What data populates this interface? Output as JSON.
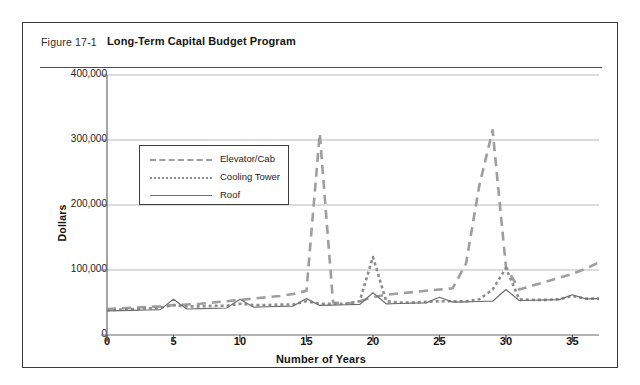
{
  "figure": {
    "number": "Figure 17-1",
    "title": "Long-Term Capital Budget Program"
  },
  "chart_data": {
    "type": "line",
    "title": "Long-Term Capital Budget Program",
    "xlabel": "Number of Years",
    "ylabel": "Dollars",
    "xlim": [
      0,
      37
    ],
    "ylim": [
      0,
      400000
    ],
    "grid": true,
    "legend_position": "upper-left-inside",
    "xticks": [
      0,
      5,
      10,
      15,
      20,
      25,
      30,
      35
    ],
    "xtick_labels": [
      "0",
      "5",
      "10",
      "15",
      "20",
      "25",
      "30",
      "35"
    ],
    "yticks": [
      0,
      100000,
      200000,
      300000,
      400000
    ],
    "ytick_labels": [
      "0",
      "100,000",
      "200,000",
      "300,000",
      "400,000"
    ],
    "x": [
      0,
      1,
      2,
      3,
      4,
      5,
      6,
      7,
      8,
      9,
      10,
      11,
      12,
      13,
      14,
      15,
      16,
      17,
      18,
      19,
      20,
      21,
      22,
      23,
      24,
      25,
      26,
      27,
      28,
      29,
      30,
      31,
      32,
      33,
      34,
      35,
      36,
      37
    ],
    "series": [
      {
        "name": "Elevator/Cab",
        "style": "dashed",
        "color": "#9e9e9e",
        "values": [
          40000,
          41000,
          42000,
          43000,
          44000,
          46000,
          47000,
          48000,
          50000,
          52000,
          54000,
          56000,
          58000,
          60000,
          63000,
          68000,
          310000,
          50000,
          48000,
          52000,
          58000,
          62000,
          64000,
          66000,
          68000,
          70000,
          72000,
          110000,
          230000,
          315000,
          105000,
          70000,
          76000,
          82000,
          88000,
          94000,
          102000,
          112000
        ]
      },
      {
        "name": "Cooling Tower",
        "style": "dotted",
        "color": "#8d8d8d",
        "values": [
          38000,
          39000,
          40000,
          41000,
          42000,
          46000,
          44000,
          44000,
          45000,
          45000,
          48000,
          46000,
          46000,
          47000,
          47000,
          52000,
          48000,
          48000,
          48000,
          52000,
          120000,
          52000,
          50000,
          50000,
          51000,
          52000,
          52000,
          52000,
          55000,
          70000,
          103000,
          55000,
          54000,
          54000,
          55000,
          60000,
          56000,
          56000
        ]
      },
      {
        "name": "Roof",
        "style": "solid",
        "color": "#6f6f6f",
        "values": [
          37000,
          37500,
          38000,
          38500,
          39000,
          55000,
          40000,
          40500,
          41000,
          41500,
          55000,
          43000,
          43500,
          44000,
          44500,
          56000,
          45500,
          46000,
          46500,
          47000,
          65000,
          48000,
          48500,
          49000,
          49500,
          58000,
          50500,
          51000,
          51500,
          52000,
          70000,
          53000,
          53500,
          54000,
          54500,
          62000,
          55500,
          56000
        ]
      }
    ]
  }
}
